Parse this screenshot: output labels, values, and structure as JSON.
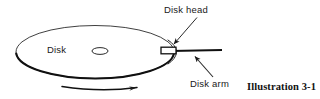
{
  "figure": {
    "name": "disk-drive-diagram",
    "caption": "Illustration 3-1",
    "background_color": "#ffffff",
    "stroke_color": "#1a1a1a",
    "labels": {
      "disk": "Disk",
      "disk_head": "Disk head",
      "disk_arm": "Disk arm"
    },
    "parts": {
      "platter": {
        "name": "disk-platter",
        "shape": "ellipse",
        "center": [
          95,
          52
        ],
        "radius_x": 80,
        "radius_y": 27
      },
      "spindle_hole": {
        "name": "spindle-hole",
        "shape": "ellipse",
        "center": [
          100,
          51
        ],
        "radius_x": 8,
        "radius_y": 3.5
      },
      "head": {
        "name": "read-write-head",
        "shape": "rectangle",
        "x": 161,
        "y": 47,
        "width": 15,
        "height": 7
      },
      "arm": {
        "name": "actuator-arm",
        "shape": "line",
        "from": [
          172,
          51
        ],
        "to": [
          222,
          50
        ]
      },
      "rotation_arrow": {
        "name": "rotation-direction-arrow",
        "shape": "curved-arrow",
        "from": [
          62,
          88
        ],
        "to": [
          141,
          88
        ],
        "direction": "clockwise-right"
      }
    },
    "leaders": [
      {
        "name": "disk-head-leader",
        "from": [
          197,
          17
        ],
        "to": [
          172,
          45
        ]
      },
      {
        "name": "disk-arm-leader",
        "from": [
          213,
          77
        ],
        "to": [
          194,
          56
        ]
      }
    ]
  }
}
